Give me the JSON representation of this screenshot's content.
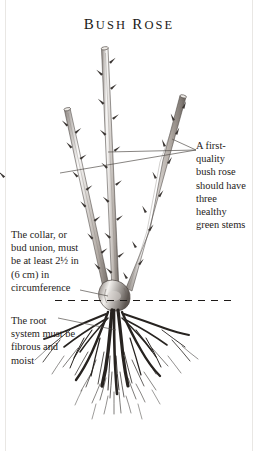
{
  "figure": {
    "title": "Bush rose",
    "title_initials": {
      "b": "B",
      "r": "R"
    },
    "title_rest": {
      "ush": "USH",
      "ose": "OSE"
    }
  },
  "captions": {
    "stems": {
      "name": "stems-annotation",
      "lines": [
        "A first-",
        "quality",
        "bush rose",
        "should have",
        "three",
        "healthy",
        "green stems"
      ]
    },
    "collar": {
      "name": "collar-annotation",
      "lines": [
        "The collar, or",
        "bud union, must",
        "be  at least 2½ in",
        "(6 cm) in",
        "circumference"
      ]
    },
    "roots": {
      "name": "roots-annotation",
      "lines": [
        "The root",
        "system must be",
        "fibrous and",
        "moist"
      ]
    }
  },
  "illustration": {
    "subject": "bare-root bush rose with three pruned stems, bud union collar and fibrous root system",
    "soil_line_label": "soil level dashed line",
    "stem_count": 3,
    "ink_color": "#2b2724",
    "line_color": "#3b3633",
    "paper_color": "#ffffff"
  }
}
